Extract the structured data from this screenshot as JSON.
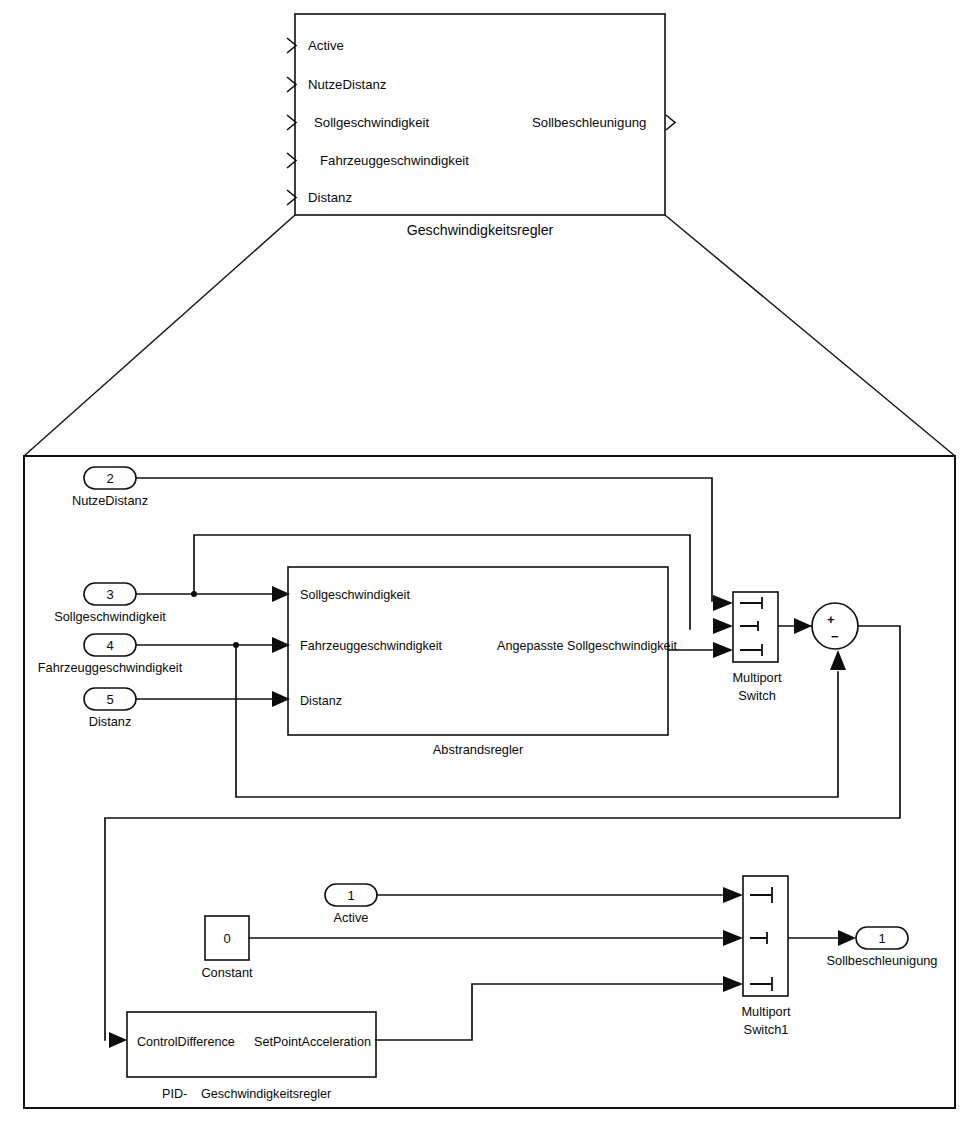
{
  "diagram": {
    "title": "Geschwindigkeitsregler",
    "type": "block-diagram",
    "style": "simulink"
  },
  "top_block": {
    "name": "Geschwindigkeitsregler",
    "inputs": [
      "Active",
      "NutzeDistanz",
      "Sollgeschwindigkeit",
      "Fahrzeuggeschwindigkeit",
      "Distanz"
    ],
    "outputs": [
      "Sollbeschleunigung"
    ]
  },
  "subsystem": {
    "inports": [
      {
        "num": "2",
        "label": "NutzeDistanz"
      },
      {
        "num": "3",
        "label": "Sollgeschwindigkeit"
      },
      {
        "num": "4",
        "label": "Fahrzeuggeschwindigkeit"
      },
      {
        "num": "5",
        "label": "Distanz"
      },
      {
        "num": "1",
        "label": "Active"
      }
    ],
    "outports": [
      {
        "num": "1",
        "label": "Sollbeschleunigung"
      }
    ],
    "blocks": [
      {
        "name": "Abstrandsregler",
        "inputs": [
          "Sollgeschwindigkeit",
          "Fahrzeuggeschwindigkeit",
          "Distanz"
        ],
        "outputs": [
          "Angepasste Sollgeschwindigkeit"
        ]
      },
      {
        "name": "Multiport\nSwitch",
        "name_line1": "Multiport",
        "name_line2": "Switch",
        "inputs": 3
      },
      {
        "name": "Multiport\nSwitch1",
        "name_line1": "Multiport",
        "name_line2": "Switch1",
        "inputs": 3
      },
      {
        "name": "Constant",
        "value": "0"
      },
      {
        "name": "PID-  Geschwindigkeitsregler",
        "name_prefix": "PID-",
        "name_rest": "Geschwindigkeitsregler",
        "inputs": [
          "ControlDifference"
        ],
        "outputs": [
          "SetPointAcceleration"
        ]
      },
      {
        "name": "Sum",
        "sign_plus": "+",
        "sign_minus": "−"
      }
    ]
  },
  "colors": {
    "line": "#111111",
    "background": "#ffffff",
    "text": "#0a0a0a"
  }
}
